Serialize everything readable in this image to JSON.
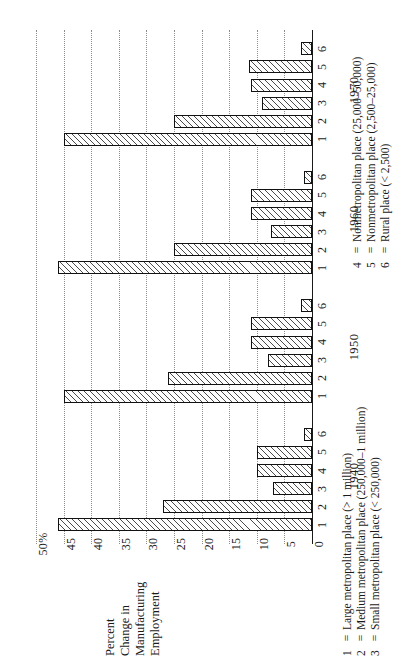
{
  "chart_data": {
    "type": "bar",
    "orientation": "horizontal",
    "title": "",
    "xlabel": "Percent Change in Manufacturing Employment",
    "ylabel": "",
    "ylim": [
      0,
      50
    ],
    "grid": true,
    "axis_title_lines": [
      "Percent",
      "Change in",
      "Manufacturing",
      "Employment"
    ],
    "value_ticks": [
      "50%",
      "45",
      "40",
      "35",
      "30",
      "25",
      "20",
      "15",
      "10",
      "5",
      "0"
    ],
    "value_tick_numbers": [
      50,
      45,
      40,
      35,
      30,
      25,
      20,
      15,
      10,
      5,
      0
    ],
    "categories": [
      "1",
      "2",
      "3",
      "4",
      "5",
      "6"
    ],
    "group_labels": [
      "1940",
      "1950",
      "1960",
      "1970"
    ],
    "series": [
      {
        "name": "1940",
        "values": [
          46.0,
          27.0,
          7.0,
          10.0,
          10.0,
          1.5
        ]
      },
      {
        "name": "1950",
        "values": [
          45.0,
          26.0,
          8.0,
          11.0,
          11.0,
          2.0
        ]
      },
      {
        "name": "1960",
        "values": [
          46.0,
          25.0,
          7.5,
          11.0,
          11.0,
          1.5
        ]
      },
      {
        "name": "1970",
        "values": [
          45.0,
          25.0,
          9.0,
          11.0,
          11.5,
          2.0
        ]
      }
    ],
    "legend_position": "right",
    "legend": [
      {
        "key": "1",
        "eq": "=",
        "label": "Large metropolitan place (> 1 million)"
      },
      {
        "key": "2",
        "eq": "=",
        "label": "Medium metropolitan place (250,000–1 million)"
      },
      {
        "key": "3",
        "eq": "=",
        "label": "Small metropolitan place (< 250,000)"
      },
      {
        "key": "4",
        "eq": "=",
        "label": "Nonmetropolitan place (25,000–50,000)"
      },
      {
        "key": "5",
        "eq": "=",
        "label": "Nonmetropolitan place (2,500–25,000)"
      },
      {
        "key": "6",
        "eq": "=",
        "label": "Rural place (< 2,500)"
      }
    ],
    "colors": {
      "bar_fill": "#fdfdfd",
      "bar_hatch": "#4a4a4a",
      "bar_border": "#111111",
      "gridline": "#8d8d8d",
      "axis": "#1a1a1a",
      "background": "#ffffff"
    }
  }
}
